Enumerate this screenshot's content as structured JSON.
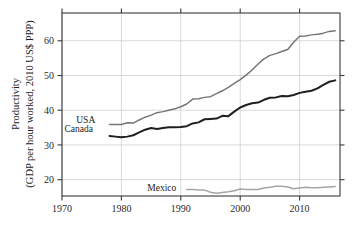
{
  "chart_data": {
    "type": "line",
    "title": "",
    "xlabel": "",
    "ylabel": "Productivity (GDP per hour worked, 2010 US$ PPP)",
    "ylabel_line1": "Productivity",
    "ylabel_line2": "(GDP per hour worked, 2010 US$ PPP)",
    "xlim": [
      1970,
      2016.8
    ],
    "ylim": [
      15.3,
      68.0
    ],
    "xticks": [
      1970,
      1980,
      1990,
      2000,
      2010
    ],
    "xticklabels": [
      "1970",
      "1980",
      "1990",
      "2000",
      "2010"
    ],
    "yticks": [
      20,
      30,
      40,
      50,
      60
    ],
    "yticklabels": [
      "20",
      "30",
      "40",
      "50",
      "60"
    ],
    "grid": true,
    "grid_color": "#c9c9c9",
    "legend_position": "inline-labels",
    "colors": {
      "usa": "#767676",
      "canada": "#1f1f1f",
      "mexico": "#a5a5a5",
      "axis": "#3a3a3a",
      "background": "#ffffff"
    },
    "series": [
      {
        "name": "USA",
        "color": "#767676",
        "label_x": 1974.0,
        "label_y": 37.4,
        "x": [
          1978,
          1979,
          1980,
          1981,
          1982,
          1983,
          1984,
          1985,
          1986,
          1987,
          1988,
          1989,
          1990,
          1991,
          1992,
          1993,
          1994,
          1995,
          1996,
          1997,
          1998,
          1999,
          2000,
          2001,
          2002,
          2003,
          2004,
          2005,
          2006,
          2007,
          2008,
          2009,
          2010,
          2011,
          2012,
          2013,
          2014,
          2015,
          2016
        ],
        "values": [
          35.9,
          35.9,
          35.9,
          36.4,
          36.3,
          37.2,
          38.0,
          38.6,
          39.3,
          39.6,
          40.0,
          40.4,
          41.0,
          41.8,
          43.2,
          43.3,
          43.7,
          43.9,
          44.8,
          45.6,
          46.6,
          47.7,
          48.8,
          50.1,
          51.6,
          53.3,
          54.8,
          55.8,
          56.3,
          56.9,
          57.5,
          59.6,
          61.3,
          61.4,
          61.7,
          61.9,
          62.2,
          62.7,
          62.9
        ]
      },
      {
        "name": "Canada",
        "color": "#1f1f1f",
        "label_x": 1972.8,
        "label_y": 34.6,
        "x": [
          1978,
          1979,
          1980,
          1981,
          1982,
          1983,
          1984,
          1985,
          1986,
          1987,
          1988,
          1989,
          1990,
          1991,
          1992,
          1993,
          1994,
          1995,
          1996,
          1997,
          1998,
          1999,
          2000,
          2001,
          2002,
          2003,
          2004,
          2005,
          2006,
          2007,
          2008,
          2009,
          2010,
          2011,
          2012,
          2013,
          2014,
          2015,
          2016
        ],
        "values": [
          32.6,
          32.4,
          32.2,
          32.4,
          32.8,
          33.6,
          34.4,
          34.9,
          34.6,
          34.9,
          35.1,
          35.1,
          35.2,
          35.4,
          36.2,
          36.5,
          37.4,
          37.5,
          37.6,
          38.4,
          38.3,
          39.6,
          40.8,
          41.5,
          42.0,
          42.2,
          43.0,
          43.6,
          43.7,
          44.1,
          44.0,
          44.4,
          45.0,
          45.3,
          45.6,
          46.3,
          47.3,
          48.2,
          48.6
        ]
      },
      {
        "name": "Mexico",
        "color": "#a5a5a5",
        "label_x": 1986.8,
        "label_y": 17.6,
        "x": [
          1991,
          1992,
          1993,
          1994,
          1995,
          1996,
          1997,
          1998,
          1999,
          2000,
          2001,
          2002,
          2003,
          2004,
          2005,
          2006,
          2007,
          2008,
          2009,
          2010,
          2011,
          2012,
          2013,
          2014,
          2015,
          2016
        ],
        "values": [
          17.2,
          17.2,
          17.0,
          17.0,
          16.4,
          16.1,
          16.3,
          16.5,
          16.8,
          17.3,
          17.2,
          17.2,
          17.2,
          17.6,
          17.8,
          18.1,
          18.1,
          17.9,
          17.4,
          17.6,
          17.8,
          17.7,
          17.7,
          17.8,
          17.9,
          18.0
        ]
      }
    ]
  }
}
